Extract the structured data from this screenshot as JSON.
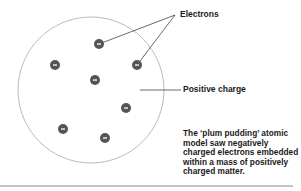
{
  "diagram": {
    "atom": {
      "cx": 91,
      "cy": 90,
      "r": 73,
      "stroke": "#a8a8a8"
    },
    "electron_style": {
      "r": 5,
      "fill": "#555555",
      "sign": "−",
      "sign_color": "#ffffff"
    },
    "electrons": [
      {
        "x": 99,
        "y": 44
      },
      {
        "x": 55,
        "y": 65
      },
      {
        "x": 137,
        "y": 65
      },
      {
        "x": 95,
        "y": 80
      },
      {
        "x": 126,
        "y": 108
      },
      {
        "x": 63,
        "y": 129
      },
      {
        "x": 105,
        "y": 138
      }
    ],
    "labels": {
      "electrons": "Electrons",
      "positive_charge": "Positive charge"
    },
    "leader_lines": {
      "electrons_apex": {
        "x": 175,
        "y": 15
      },
      "positive_charge": {
        "x1": 140,
        "y1": 90,
        "x2": 181,
        "y2": 90
      }
    },
    "caption_lines": [
      "The ‘plum pudding’ atomic",
      "model saw negatively",
      "charged electrons embedded",
      "within a mass of positively",
      "charged matter."
    ],
    "bottom_rule": {
      "x1": 0,
      "x2": 293,
      "y": 186,
      "color": "#8a8a8a"
    }
  }
}
